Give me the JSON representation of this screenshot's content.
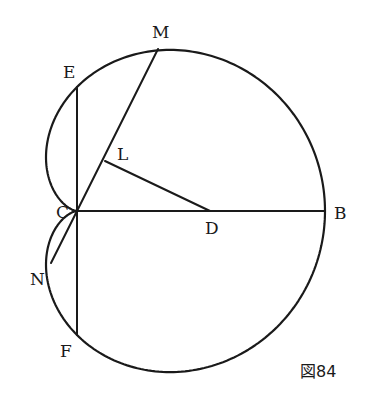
{
  "figure": {
    "caption": "図84",
    "curve_type": "cardioid",
    "pole": "C",
    "points": {
      "C": {
        "label": "C",
        "x": 77,
        "y": 211
      },
      "D": {
        "label": "D",
        "x": 210,
        "y": 211
      },
      "B": {
        "label": "B",
        "x": 325,
        "y": 211
      },
      "M": {
        "label": "M",
        "x": 158,
        "y": 49
      },
      "E": {
        "label": "E",
        "x": 77,
        "y": 87
      },
      "F": {
        "label": "F",
        "x": 77,
        "y": 335
      },
      "L": {
        "label": "L",
        "x": 105,
        "y": 161
      },
      "N": {
        "label": "N",
        "x": 51,
        "y": 263
      }
    },
    "segments": [
      [
        "C",
        "B"
      ],
      [
        "E",
        "F"
      ],
      [
        "C",
        "M"
      ],
      [
        "L",
        "D"
      ],
      [
        "C",
        "N"
      ]
    ],
    "label_positions": {
      "C": {
        "x": 56,
        "y": 218
      },
      "D": {
        "x": 205,
        "y": 234
      },
      "B": {
        "x": 334,
        "y": 219
      },
      "M": {
        "x": 152,
        "y": 38
      },
      "E": {
        "x": 63,
        "y": 78
      },
      "F": {
        "x": 60,
        "y": 357
      },
      "L": {
        "x": 117,
        "y": 160
      },
      "N": {
        "x": 30,
        "y": 285
      }
    },
    "caption_position": {
      "x": 300,
      "y": 377
    }
  }
}
